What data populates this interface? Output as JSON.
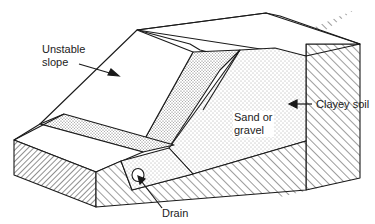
{
  "diagram": {
    "type": "slope cross-section illustration",
    "labels": {
      "unstable_slope_line1": "Unstable",
      "unstable_slope_line2": "slope",
      "sand_gravel_line1": "Sand or",
      "sand_gravel_line2": "gravel",
      "clayey_soil": "Clayey soil",
      "drain": "Drain"
    },
    "colors": {
      "stroke": "#1a1a1a",
      "background": "#ffffff",
      "stipple": "#555555"
    }
  }
}
